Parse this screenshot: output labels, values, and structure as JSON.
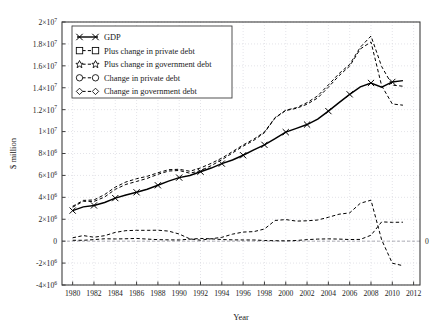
{
  "chart_data": {
    "type": "line",
    "title": "",
    "xlabel": "Year",
    "ylabel": "$ million",
    "xlim": [
      1979,
      2012.6
    ],
    "ylim": [
      -4000000,
      20000000
    ],
    "grid": true,
    "legend_position": "upper-left",
    "xticks": [
      1980,
      1982,
      1984,
      1986,
      1988,
      1990,
      1992,
      1994,
      1996,
      1998,
      2000,
      2002,
      2004,
      2006,
      2008,
      2010,
      2012
    ],
    "xtick_labels": [
      "1980",
      "1982",
      "1984",
      "1986",
      "1988",
      "1990",
      "1992",
      "1994",
      "1996",
      "1998",
      "2000",
      "2002",
      "2004",
      "2006",
      "2008",
      "2010",
      "2012"
    ],
    "yticks": [
      -4000000,
      -2000000,
      0,
      2000000,
      4000000,
      6000000,
      8000000,
      10000000,
      12000000,
      14000000,
      16000000,
      18000000,
      20000000
    ],
    "ytick_labels": [
      "-4×10",
      "-2×10",
      "0",
      "2×10",
      "4×10",
      "6×10",
      "8×10",
      "1×10",
      "1.2×10",
      "1.4×10",
      "1.6×10",
      "1.8×10",
      "2×10"
    ],
    "ytick_exponents": [
      "6",
      "6",
      "",
      "6",
      "6",
      "6",
      "6",
      "7",
      "7",
      "7",
      "7",
      "7",
      "7"
    ],
    "right_axis_zero_label": "0",
    "x": [
      1980,
      1981,
      1982,
      1983,
      1984,
      1985,
      1986,
      1987,
      1988,
      1989,
      1990,
      1991,
      1992,
      1993,
      1994,
      1995,
      1996,
      1997,
      1998,
      1999,
      2000,
      2001,
      2002,
      2003,
      2004,
      2005,
      2006,
      2007,
      2008,
      2009,
      2010,
      2011
    ],
    "series": [
      {
        "name": "GDP",
        "marker": "x",
        "linestyle": "solid",
        "color": "#000000",
        "values": [
          2790000,
          3130000,
          3260000,
          3530000,
          3930000,
          4220000,
          4460000,
          4740000,
          5100000,
          5480000,
          5800000,
          5990000,
          6340000,
          6670000,
          7080000,
          7410000,
          7840000,
          8330000,
          8790000,
          9350000,
          9950000,
          10290000,
          10640000,
          11140000,
          11870000,
          12640000,
          13400000,
          14080000,
          14440000,
          14060000,
          14530000,
          14650000
        ]
      },
      {
        "name": "Plus change in private debt",
        "marker": "square",
        "linestyle": "dashed",
        "color": "#000000",
        "values": [
          3100000,
          3640000,
          3620000,
          4030000,
          4730000,
          5180000,
          5450000,
          5730000,
          6100000,
          6400000,
          6450000,
          6200000,
          6430000,
          6890000,
          7430000,
          8050000,
          8670000,
          9200000,
          9900000,
          11240000,
          11920000,
          12120000,
          12500000,
          13070000,
          14050000,
          15100000,
          15980000,
          17540000,
          18180000,
          14180000,
          12520000,
          12410000
        ]
      },
      {
        "name": "Plus change in government debt",
        "marker": "star",
        "linestyle": "dashed",
        "color": "#000000",
        "values": [
          3180000,
          3720000,
          3760000,
          4250000,
          4930000,
          5400000,
          5700000,
          5920000,
          6240000,
          6520000,
          6560000,
          6380000,
          6680000,
          7100000,
          7580000,
          8170000,
          8780000,
          9310000,
          9960000,
          11280000,
          11950000,
          12180000,
          12640000,
          13260000,
          14260000,
          15290000,
          16130000,
          17700000,
          18720000,
          15940000,
          14240000,
          14140000
        ]
      },
      {
        "name": "Change in private debt",
        "marker": "circle",
        "linestyle": "dashed",
        "color": "#000000",
        "values": [
          310000,
          510000,
          360000,
          500000,
          800000,
          960000,
          990000,
          990000,
          1000000,
          920000,
          650000,
          210000,
          90000,
          220000,
          350000,
          640000,
          830000,
          870000,
          1110000,
          1890000,
          1970000,
          1830000,
          1860000,
          1930000,
          2180000,
          2460000,
          2580000,
          3460000,
          3740000,
          120000,
          -2010000,
          -2240000
        ]
      },
      {
        "name": "Change in government debt",
        "marker": "diamond",
        "linestyle": "dashed",
        "color": "#000000",
        "values": [
          80000,
          80000,
          140000,
          220000,
          200000,
          220000,
          250000,
          190000,
          140000,
          120000,
          110000,
          180000,
          250000,
          210000,
          150000,
          120000,
          110000,
          110000,
          60000,
          40000,
          30000,
          60000,
          140000,
          190000,
          210000,
          190000,
          150000,
          160000,
          540000,
          1760000,
          1720000,
          1730000
        ]
      }
    ],
    "legend_entries": [
      {
        "label": "GDP",
        "marker": "x",
        "linestyle": "solid"
      },
      {
        "label": "Plus change in private debt",
        "marker": "square",
        "linestyle": "dashed"
      },
      {
        "label": "Plus change in government debt",
        "marker": "star",
        "linestyle": "dashed"
      },
      {
        "label": "Change in private debt",
        "marker": "circle",
        "linestyle": "dashed"
      },
      {
        "label": "Change in government debt",
        "marker": "diamond",
        "linestyle": "dashed"
      }
    ]
  },
  "colors": {
    "axis": "#3f3f3f",
    "grid": "#d8d8e0",
    "ink": "#000000",
    "background": "#ffffff"
  }
}
